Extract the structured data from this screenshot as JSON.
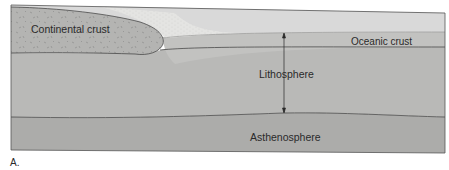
{
  "figure": {
    "panel_label": "A.",
    "layers": {
      "continental_crust": "Continental crust",
      "oceanic_crust": "Oceanic crust",
      "lithosphere": "Lithosphere",
      "asthenosphere": "Asthenosphere"
    },
    "annotation": {
      "arrow": "double-headed arrow spanning lithosphere thickness"
    },
    "colors": {
      "sky": "#d9d9d9",
      "sediment": "#e6e6e4",
      "continental_crust": "#b4b4b2",
      "oceanic_crust": "#c2c2c0",
      "lithosphere": "#b9b9b7",
      "asthenosphere": "#acacaa",
      "lines": "#3a3a3a"
    }
  }
}
